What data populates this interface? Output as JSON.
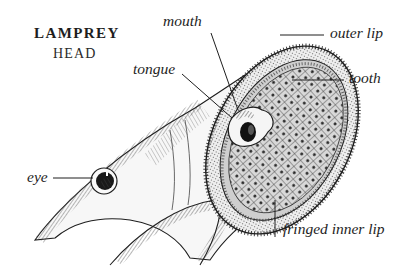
{
  "title": {
    "main": "LAMPREY",
    "sub": "HEAD"
  },
  "labels": {
    "mouth": "mouth",
    "tongue": "tongue",
    "outer_lip": "outer lip",
    "tooth": "tooth",
    "eye": "eye",
    "fringed_inner_lip": "fringed inner lip"
  },
  "colors": {
    "ink": "#1e1e1e",
    "background": "#ffffff",
    "shade": "#888888"
  }
}
